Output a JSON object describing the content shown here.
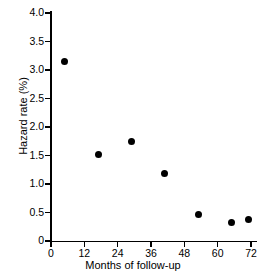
{
  "chart_data": {
    "type": "scatter",
    "title": "",
    "xlabel": "Months of follow-up",
    "ylabel": "Hazard rate (%)",
    "xlim": [
      0,
      72
    ],
    "ylim": [
      0,
      4.0
    ],
    "grid": false,
    "legend": null,
    "x_ticks": [
      0,
      12,
      24,
      36,
      48,
      60,
      72
    ],
    "x_tick_labels": [
      "0",
      "12",
      "24",
      "36",
      "48",
      "60",
      "72"
    ],
    "y_ticks": [
      0,
      0.5,
      1.0,
      1.5,
      2.0,
      2.5,
      3.0,
      3.5,
      4.0
    ],
    "y_tick_labels": [
      "0",
      "0.5",
      "1.0",
      "1.5",
      "2.0",
      "2.5",
      "3.0",
      "3.5",
      "4.0"
    ],
    "marker": "filled-circle",
    "marker_color": "#000000",
    "x": [
      5,
      17,
      29,
      41,
      53,
      65,
      71
    ],
    "y": [
      3.15,
      1.51,
      1.74,
      1.19,
      0.47,
      0.32,
      0.37
    ],
    "points": [
      {
        "x": 5,
        "y": 3.15
      },
      {
        "x": 17,
        "y": 1.51
      },
      {
        "x": 29,
        "y": 1.74
      },
      {
        "x": 41,
        "y": 1.19
      },
      {
        "x": 53,
        "y": 0.47
      },
      {
        "x": 65,
        "y": 0.32
      },
      {
        "x": 71,
        "y": 0.37
      }
    ]
  },
  "axes": {
    "y_axis_title": "Hazard rate (%)",
    "x_axis_title": "Months of follow-up"
  }
}
